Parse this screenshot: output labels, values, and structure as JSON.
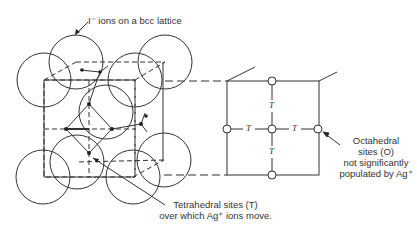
{
  "labels": {
    "top": "I⁻ ions on a bcc lattice",
    "tetra_line1": "Tetrahedral sites (T)",
    "tetra_line2": "over which Ag⁺ ions move.",
    "octa_line1": "Octahedral",
    "octa_line2": "sites (O)",
    "octa_line3": "not significantly",
    "octa_line4": "populated by Ag⁺"
  },
  "face_diagram": {
    "tetrahedral_symbol": "T",
    "t_marks": [
      "T",
      "T",
      "T",
      "T"
    ]
  },
  "colors": {
    "line": "#333333",
    "background": "#ffffff"
  }
}
